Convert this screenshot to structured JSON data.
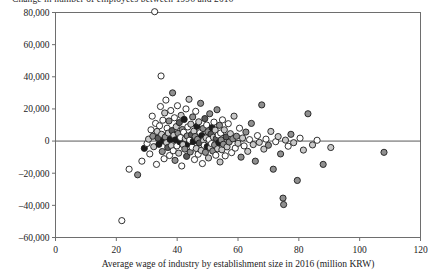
{
  "chart_data": {
    "type": "scatter",
    "title": "Change in number of employees between 1996 and 2016",
    "xlabel": "Average wage of industry by establishment size in 2016 (million KRW)",
    "ylabel": "",
    "xlim": [
      0,
      120
    ],
    "ylim": [
      -60000,
      80000
    ],
    "xticks": [
      0,
      20,
      40,
      60,
      80,
      100,
      120
    ],
    "xtick_labels": [
      "0",
      "20",
      "40",
      "60",
      "80",
      "100",
      "120"
    ],
    "yticks": [
      -60000,
      -40000,
      -20000,
      0,
      20000,
      40000,
      60000,
      80000
    ],
    "ytick_labels": [
      "–60,000",
      "–40,000",
      "–20,000",
      "0",
      "20,000",
      "40,000",
      "60,000",
      "80,000"
    ],
    "grid": false,
    "legend": null,
    "reference_line": {
      "orientation": "horizontal",
      "y": 0
    },
    "marker": {
      "shape": "circle",
      "radius_px": 3.1,
      "edge_color": "#1c1c1c"
    },
    "fill_palette": [
      "#ffffff",
      "#c8c8c8",
      "#8f8f8f",
      "#5a5a5a",
      "#1c1c1c"
    ],
    "points": [
      [
        21.8,
        -49500,
        "#ffffff"
      ],
      [
        24.2,
        -17500,
        "#ffffff"
      ],
      [
        27.0,
        -21000,
        "#8f8f8f"
      ],
      [
        28.4,
        -12500,
        "#ffffff"
      ],
      [
        29.2,
        -4500,
        "#1c1c1c"
      ],
      [
        30.1,
        -1500,
        "#ffffff"
      ],
      [
        30.6,
        1200,
        "#c8c8c8"
      ],
      [
        31.0,
        -8000,
        "#ffffff"
      ],
      [
        31.4,
        7000,
        "#ffffff"
      ],
      [
        31.8,
        15500,
        "#ffffff"
      ],
      [
        32.0,
        3000,
        "#8f8f8f"
      ],
      [
        32.3,
        -3500,
        "#c8c8c8"
      ],
      [
        32.6,
        80500,
        "#ffffff"
      ],
      [
        32.9,
        11000,
        "#ffffff"
      ],
      [
        33.2,
        -14500,
        "#ffffff"
      ],
      [
        33.4,
        6000,
        "#c8c8c8"
      ],
      [
        33.7,
        1800,
        "#5a5a5a"
      ],
      [
        34.0,
        -2000,
        "#1c1c1c"
      ],
      [
        34.2,
        9500,
        "#ffffff"
      ],
      [
        34.5,
        21500,
        "#ffffff"
      ],
      [
        34.7,
        40500,
        "#ffffff"
      ],
      [
        34.9,
        4200,
        "#c8c8c8"
      ],
      [
        35.1,
        -6500,
        "#8f8f8f"
      ],
      [
        35.3,
        13000,
        "#ffffff"
      ],
      [
        35.5,
        300,
        "#1c1c1c"
      ],
      [
        35.7,
        -11000,
        "#ffffff"
      ],
      [
        35.9,
        17500,
        "#c8c8c8"
      ],
      [
        36.1,
        2500,
        "#8f8f8f"
      ],
      [
        36.3,
        25500,
        "#ffffff"
      ],
      [
        36.5,
        -1000,
        "#c8c8c8"
      ],
      [
        36.7,
        8000,
        "#ffffff"
      ],
      [
        36.9,
        -4000,
        "#5a5a5a"
      ],
      [
        37.1,
        5000,
        "#c8c8c8"
      ],
      [
        37.3,
        12500,
        "#8f8f8f"
      ],
      [
        37.5,
        -9000,
        "#ffffff"
      ],
      [
        37.7,
        1000,
        "#1c1c1c"
      ],
      [
        37.9,
        19000,
        "#ffffff"
      ],
      [
        38.1,
        -2800,
        "#c8c8c8"
      ],
      [
        38.3,
        6500,
        "#5a5a5a"
      ],
      [
        38.5,
        30000,
        "#8f8f8f"
      ],
      [
        38.7,
        -6000,
        "#ffffff"
      ],
      [
        38.9,
        3600,
        "#c8c8c8"
      ],
      [
        39.1,
        14500,
        "#ffffff"
      ],
      [
        39.3,
        -12000,
        "#8f8f8f"
      ],
      [
        39.5,
        800,
        "#1c1c1c"
      ],
      [
        39.7,
        9000,
        "#c8c8c8"
      ],
      [
        39.9,
        -3000,
        "#ffffff"
      ],
      [
        40.1,
        22000,
        "#ffffff"
      ],
      [
        40.3,
        4800,
        "#8f8f8f"
      ],
      [
        40.5,
        -7500,
        "#c8c8c8"
      ],
      [
        40.7,
        11500,
        "#5a5a5a"
      ],
      [
        40.9,
        -500,
        "#1c1c1c"
      ],
      [
        41.1,
        2200,
        "#ffffff"
      ],
      [
        41.3,
        16000,
        "#c8c8c8"
      ],
      [
        41.5,
        -15500,
        "#ffffff"
      ],
      [
        41.7,
        7200,
        "#8f8f8f"
      ],
      [
        41.9,
        -2200,
        "#c8c8c8"
      ],
      [
        42.1,
        5500,
        "#ffffff"
      ],
      [
        42.3,
        13500,
        "#1c1c1c"
      ],
      [
        42.5,
        -5000,
        "#8f8f8f"
      ],
      [
        42.7,
        1500,
        "#c8c8c8"
      ],
      [
        42.9,
        20000,
        "#ffffff"
      ],
      [
        43.1,
        -9500,
        "#5a5a5a"
      ],
      [
        43.3,
        3200,
        "#8f8f8f"
      ],
      [
        43.5,
        8800,
        "#ffffff"
      ],
      [
        43.7,
        -1800,
        "#1c1c1c"
      ],
      [
        43.9,
        26000,
        "#c8c8c8"
      ],
      [
        44.1,
        600,
        "#ffffff"
      ],
      [
        44.3,
        -6800,
        "#8f8f8f"
      ],
      [
        44.5,
        10500,
        "#c8c8c8"
      ],
      [
        44.7,
        4000,
        "#5a5a5a"
      ],
      [
        44.9,
        -3800,
        "#ffffff"
      ],
      [
        45.1,
        15000,
        "#8f8f8f"
      ],
      [
        45.3,
        -200,
        "#1c1c1c"
      ],
      [
        45.5,
        6200,
        "#c8c8c8"
      ],
      [
        45.7,
        -11500,
        "#ffffff"
      ],
      [
        45.9,
        2800,
        "#8f8f8f"
      ],
      [
        46.1,
        18500,
        "#ffffff"
      ],
      [
        46.3,
        -4600,
        "#c8c8c8"
      ],
      [
        46.5,
        9200,
        "#1c1c1c"
      ],
      [
        46.7,
        1100,
        "#8f8f8f"
      ],
      [
        46.9,
        -8200,
        "#ffffff"
      ],
      [
        47.1,
        12000,
        "#c8c8c8"
      ],
      [
        47.3,
        -1200,
        "#5a5a5a"
      ],
      [
        47.5,
        5200,
        "#ffffff"
      ],
      [
        47.7,
        23500,
        "#8f8f8f"
      ],
      [
        47.9,
        -5800,
        "#c8c8c8"
      ],
      [
        48.1,
        3400,
        "#1c1c1c"
      ],
      [
        48.3,
        -14000,
        "#ffffff"
      ],
      [
        48.5,
        7800,
        "#8f8f8f"
      ],
      [
        48.7,
        400,
        "#c8c8c8"
      ],
      [
        48.9,
        -2600,
        "#ffffff"
      ],
      [
        49.1,
        14000,
        "#5a5a5a"
      ],
      [
        49.3,
        -7000,
        "#8f8f8f"
      ],
      [
        49.5,
        2000,
        "#c8c8c8"
      ],
      [
        49.7,
        10000,
        "#ffffff"
      ],
      [
        49.9,
        -3400,
        "#1c1c1c"
      ],
      [
        50.1,
        5800,
        "#8f8f8f"
      ],
      [
        50.3,
        -10500,
        "#c8c8c8"
      ],
      [
        50.5,
        900,
        "#ffffff"
      ],
      [
        50.7,
        17000,
        "#8f8f8f"
      ],
      [
        50.9,
        -4200,
        "#c8c8c8"
      ],
      [
        51.1,
        4400,
        "#5a5a5a"
      ],
      [
        51.3,
        -1600,
        "#ffffff"
      ],
      [
        51.5,
        8400,
        "#1c1c1c"
      ],
      [
        51.7,
        -6200,
        "#8f8f8f"
      ],
      [
        51.9,
        2400,
        "#c8c8c8"
      ],
      [
        52.1,
        11800,
        "#ffffff"
      ],
      [
        52.3,
        -2400,
        "#8f8f8f"
      ],
      [
        52.5,
        6800,
        "#c8c8c8"
      ],
      [
        52.7,
        -8800,
        "#ffffff"
      ],
      [
        52.9,
        1600,
        "#5a5a5a"
      ],
      [
        53.1,
        19500,
        "#8f8f8f"
      ],
      [
        53.3,
        -4800,
        "#c8c8c8"
      ],
      [
        53.5,
        3800,
        "#ffffff"
      ],
      [
        53.7,
        -1000,
        "#1c1c1c"
      ],
      [
        53.9,
        9800,
        "#8f8f8f"
      ],
      [
        54.1,
        -13000,
        "#c8c8c8"
      ],
      [
        54.3,
        5000,
        "#ffffff"
      ],
      [
        54.5,
        700,
        "#8f8f8f"
      ],
      [
        54.7,
        -5400,
        "#c8c8c8"
      ],
      [
        54.9,
        13200,
        "#ffffff"
      ],
      [
        55.2,
        -2000,
        "#8f8f8f"
      ],
      [
        55.5,
        7000,
        "#c8c8c8"
      ],
      [
        55.8,
        -9200,
        "#ffffff"
      ],
      [
        56.1,
        2600,
        "#5a5a5a"
      ],
      [
        56.4,
        -3600,
        "#c8c8c8"
      ],
      [
        56.8,
        10800,
        "#ffffff"
      ],
      [
        57.1,
        -600,
        "#8f8f8f"
      ],
      [
        57.5,
        4600,
        "#c8c8c8"
      ],
      [
        57.9,
        -7200,
        "#ffffff"
      ],
      [
        58.3,
        1400,
        "#8f8f8f"
      ],
      [
        58.7,
        15500,
        "#c8c8c8"
      ],
      [
        59.1,
        -4400,
        "#ffffff"
      ],
      [
        59.5,
        3000,
        "#8f8f8f"
      ],
      [
        60.0,
        -1400,
        "#c8c8c8"
      ],
      [
        60.5,
        8000,
        "#ffffff"
      ],
      [
        61.0,
        -10000,
        "#8f8f8f"
      ],
      [
        61.5,
        1900,
        "#c8c8c8"
      ],
      [
        62.0,
        -3000,
        "#ffffff"
      ],
      [
        62.6,
        5600,
        "#8f8f8f"
      ],
      [
        63.2,
        -6400,
        "#c8c8c8"
      ],
      [
        63.8,
        900,
        "#ffffff"
      ],
      [
        64.4,
        11000,
        "#8f8f8f"
      ],
      [
        65.0,
        -2200,
        "#c8c8c8"
      ],
      [
        65.7,
        -12500,
        "#8f8f8f"
      ],
      [
        66.4,
        3400,
        "#ffffff"
      ],
      [
        67.0,
        -800,
        "#c8c8c8"
      ],
      [
        67.8,
        22500,
        "#8f8f8f"
      ],
      [
        68.5,
        -5000,
        "#c8c8c8"
      ],
      [
        69.2,
        1200,
        "#ffffff"
      ],
      [
        70.0,
        -2600,
        "#8f8f8f"
      ],
      [
        70.8,
        6000,
        "#c8c8c8"
      ],
      [
        71.6,
        -17500,
        "#8f8f8f"
      ],
      [
        72.4,
        -400,
        "#ffffff"
      ],
      [
        73.2,
        2800,
        "#c8c8c8"
      ],
      [
        74.0,
        -8000,
        "#8f8f8f"
      ],
      [
        74.8,
        -35500,
        "#8f8f8f"
      ],
      [
        75.0,
        -39500,
        "#8f8f8f"
      ],
      [
        75.6,
        600,
        "#c8c8c8"
      ],
      [
        76.5,
        -3200,
        "#ffffff"
      ],
      [
        77.4,
        4200,
        "#8f8f8f"
      ],
      [
        78.3,
        -1000,
        "#c8c8c8"
      ],
      [
        79.5,
        -24500,
        "#8f8f8f"
      ],
      [
        80.4,
        1800,
        "#ffffff"
      ],
      [
        81.5,
        -5600,
        "#c8c8c8"
      ],
      [
        83.0,
        17000,
        "#8f8f8f"
      ],
      [
        84.5,
        -2400,
        "#c8c8c8"
      ],
      [
        86.0,
        500,
        "#ffffff"
      ],
      [
        88.0,
        -14500,
        "#8f8f8f"
      ],
      [
        90.5,
        -4000,
        "#c8c8c8"
      ],
      [
        108.0,
        -7000,
        "#8f8f8f"
      ]
    ]
  }
}
